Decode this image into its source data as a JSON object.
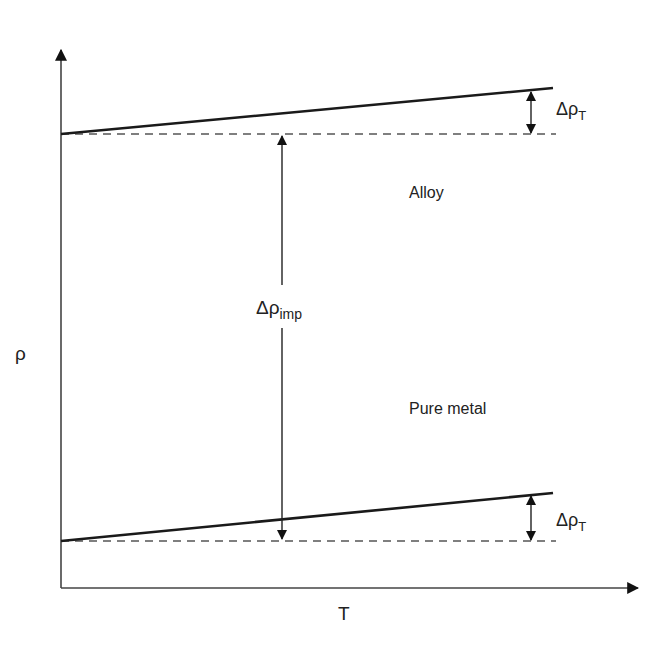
{
  "diagram": {
    "type": "resistivity-vs-temperature",
    "axes": {
      "y_label": "ρ",
      "x_label": "T"
    },
    "lines": [
      {
        "name": "Alloy",
        "label": "Alloy",
        "start": [
          61,
          134
        ],
        "end": [
          553,
          88
        ],
        "baseline_y": 134
      },
      {
        "name": "Pure metal",
        "label": "Pure metal",
        "start": [
          61,
          541
        ],
        "end": [
          553,
          493
        ],
        "baseline_y": 541
      }
    ],
    "annotations": {
      "delta_imp": {
        "main": "Δρ",
        "sub": "imp"
      },
      "delta_T_top": {
        "main": "Δρ",
        "sub": "T"
      },
      "delta_T_bottom": {
        "main": "Δρ",
        "sub": "T"
      }
    },
    "colors": {
      "line": "#1a1a1a",
      "dashed": "#555555",
      "axis": "#444444",
      "background": "#ffffff"
    }
  }
}
